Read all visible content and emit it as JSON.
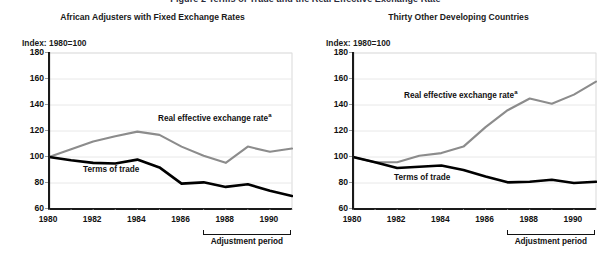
{
  "figure": {
    "clipped_heading": "Figure 2  Terms of Trade and the Real Effective Exchange Rate",
    "background": "#ffffff"
  },
  "colors": {
    "terms_of_trade": "#000000",
    "real_effective_exchange_rate": "#8c8c8c",
    "axis": "#1a1a1a",
    "gridline": "#e8e8e8",
    "frame": "#c8c8c8"
  },
  "panels": [
    {
      "id": "african-adjusters",
      "title": "African Adjusters with Fixed Exchange Rates",
      "index_label": "Index: 1980=100",
      "series_labels": {
        "reer": "Real effective exchange rate",
        "reer_sup": "a",
        "tot": "Terms of trade"
      },
      "adjustment_label": "Adjustment period",
      "adjustment_range": [
        1987,
        1991
      ],
      "chart_data": {
        "type": "line",
        "title": "African Adjusters with Fixed Exchange Rates",
        "xlabel": "",
        "ylabel": "Index: 1980=100",
        "ylim": [
          60,
          180
        ],
        "xlim": [
          1980,
          1991
        ],
        "yticks": [
          60,
          80,
          100,
          120,
          140,
          160,
          180
        ],
        "xticks": [
          1980,
          1982,
          1984,
          1986,
          1988,
          1990
        ],
        "grid": true,
        "legend": "inline-annotations",
        "x": [
          1980,
          1981,
          1982,
          1983,
          1984,
          1985,
          1986,
          1987,
          1988,
          1989,
          1990,
          1991
        ],
        "series": [
          {
            "name": "Real effective exchange rate",
            "color": "#8c8c8c",
            "values": [
              100,
              106,
              112,
              116,
              119.5,
              117,
              108,
              101,
              95.5,
              108,
              104,
              106.5
            ]
          },
          {
            "name": "Terms of trade",
            "color": "#000000",
            "values": [
              100,
              97.5,
              95.5,
              95,
              98,
              92,
              79.5,
              80.5,
              77,
              79,
              74,
              70
            ]
          }
        ]
      }
    },
    {
      "id": "thirty-other-developing-countries",
      "title": "Thirty Other Developing Countries",
      "index_label": "Index: 1980=100",
      "series_labels": {
        "reer": "Real effective exchange rate",
        "reer_sup": "a",
        "tot": "Terms of trade"
      },
      "adjustment_label": "Adjustment period",
      "adjustment_range": [
        1987,
        1991
      ],
      "chart_data": {
        "type": "line",
        "title": "Thirty Other Developing Countries",
        "xlabel": "",
        "ylabel": "Index: 1980=100",
        "ylim": [
          60,
          180
        ],
        "xlim": [
          1980,
          1991
        ],
        "yticks": [
          60,
          80,
          100,
          120,
          140,
          160,
          180
        ],
        "xticks": [
          1980,
          1982,
          1984,
          1986,
          1988,
          1990
        ],
        "grid": true,
        "legend": "inline-annotations",
        "x": [
          1980,
          1981,
          1982,
          1983,
          1984,
          1985,
          1986,
          1987,
          1988,
          1989,
          1990,
          1991
        ],
        "series": [
          {
            "name": "Real effective exchange rate",
            "color": "#8c8c8c",
            "values": [
              100,
              96,
              96,
              101,
              103,
              108,
              123,
              136,
              145,
              141,
              148,
              158
            ]
          },
          {
            "name": "Terms of trade",
            "color": "#000000",
            "values": [
              100,
              96,
              91.5,
              92.5,
              93.5,
              90,
              85,
              80.5,
              81,
              82.5,
              80,
              81
            ]
          }
        ]
      }
    }
  ]
}
